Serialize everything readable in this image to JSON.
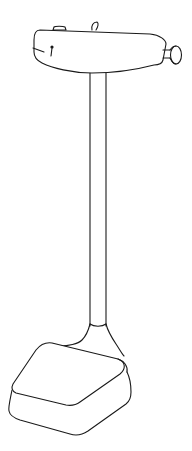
{
  "image": {
    "subject": "physician beam scale line drawing",
    "colors": {
      "background": "#ffffff",
      "line": "#1a1a1a"
    },
    "parts": {
      "head": "scale-head",
      "knob": "adjustment-knob",
      "column": "scale-column",
      "platform": "scale-platform"
    }
  }
}
